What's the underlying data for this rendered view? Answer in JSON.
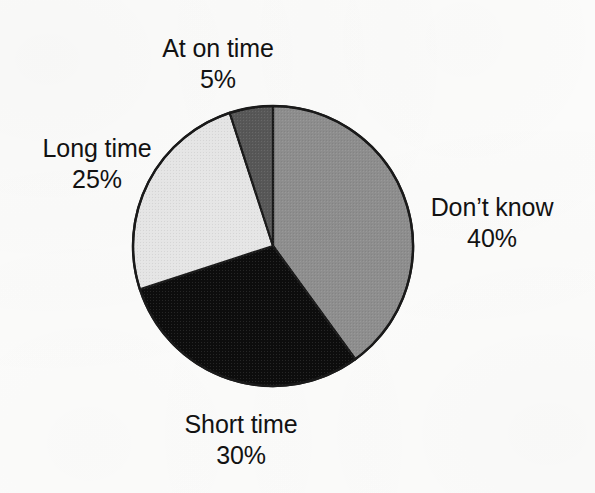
{
  "chart_data": {
    "type": "pie",
    "title": "",
    "xlabel": "",
    "ylabel": "",
    "legend_position": "none",
    "grid": false,
    "start_angle_deg": 0,
    "direction": "clockwise",
    "center": {
      "x": 273,
      "y": 246
    },
    "radius": 140,
    "categories": [
      "Don't know",
      "Short time",
      "Long time",
      "At on time"
    ],
    "values": [
      40,
      30,
      25,
      5
    ],
    "value_unit": "%",
    "slices": [
      {
        "label": "Don't know",
        "value": 40,
        "value_label": "40%",
        "color": "#8f8f8f",
        "start_deg": 0,
        "end_deg": 144
      },
      {
        "label": "Short time",
        "value": 30,
        "value_label": "30%",
        "color": "#0d0d0d",
        "start_deg": 144,
        "end_deg": 252
      },
      {
        "label": "Long time",
        "value": 25,
        "value_label": "25%",
        "color": "#e8e8e8",
        "start_deg": 252,
        "end_deg": 342
      },
      {
        "label": "At on time",
        "value": 5,
        "value_label": "5%",
        "color": "#585858",
        "start_deg": 342,
        "end_deg": 360
      }
    ],
    "outline_color": "#1a1a1a",
    "background_color": "#fdfdfc"
  },
  "labels": {
    "at_on_time": {
      "name": "At on time",
      "value": "5%"
    },
    "long_time": {
      "name": "Long time",
      "value": "25%"
    },
    "dont_know": {
      "name": "Don’t know",
      "value": "40%"
    },
    "short_time": {
      "name": "Short time",
      "value": "30%"
    }
  }
}
